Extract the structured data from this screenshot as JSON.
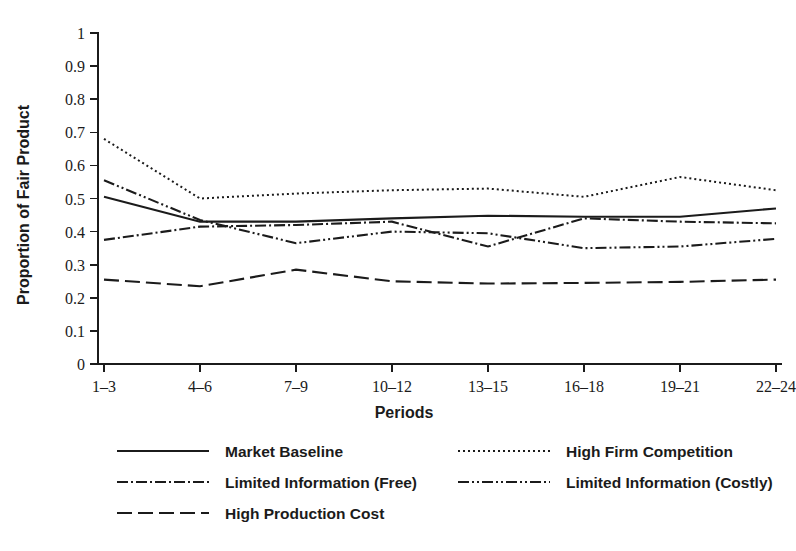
{
  "chart_data": {
    "type": "line",
    "title": "",
    "xlabel": "Periods",
    "ylabel": "Proportion of Fair Product",
    "categories": [
      "1–3",
      "4–6",
      "7–9",
      "10–12",
      "13–15",
      "16–18",
      "19–21",
      "22–24"
    ],
    "ylim": [
      0,
      1
    ],
    "xlim": [
      0,
      7
    ],
    "grid": false,
    "legend_position": "bottom",
    "yticks": [
      "0",
      "0.1",
      "0.2",
      "0.3",
      "0.4",
      "0.5",
      "0.6",
      "0.7",
      "0.8",
      "0.9",
      "1"
    ],
    "ytick_values": [
      0,
      0.1,
      0.2,
      0.3,
      0.4,
      0.5,
      0.6,
      0.7,
      0.8,
      0.9,
      1
    ],
    "series": [
      {
        "name": "Market Baseline",
        "dash": "solid",
        "color": "#1b1b1b",
        "values": [
          0.505,
          0.43,
          0.43,
          0.44,
          0.448,
          0.445,
          0.445,
          0.47
        ]
      },
      {
        "name": "High Firm Competition",
        "dash": "dotted",
        "color": "#1b1b1b",
        "values": [
          0.68,
          0.5,
          0.515,
          0.525,
          0.53,
          0.505,
          0.565,
          0.525
        ]
      },
      {
        "name": "Limited Information (Free)",
        "dash": "dashdot",
        "color": "#1b1b1b",
        "values": [
          0.375,
          0.415,
          0.42,
          0.43,
          0.355,
          0.44,
          0.43,
          0.425
        ]
      },
      {
        "name": "Limited Information (Costly)",
        "dash": "dashdotdot",
        "color": "#1b1b1b",
        "values": [
          0.555,
          0.435,
          0.365,
          0.4,
          0.395,
          0.35,
          0.355,
          0.378
        ]
      },
      {
        "name": "High Production Cost",
        "dash": "longdash",
        "color": "#1b1b1b",
        "values": [
          0.255,
          0.235,
          0.285,
          0.25,
          0.243,
          0.245,
          0.248,
          0.255
        ]
      }
    ],
    "legend_layout": [
      [
        0,
        1
      ],
      [
        2,
        3
      ],
      [
        4
      ]
    ]
  }
}
